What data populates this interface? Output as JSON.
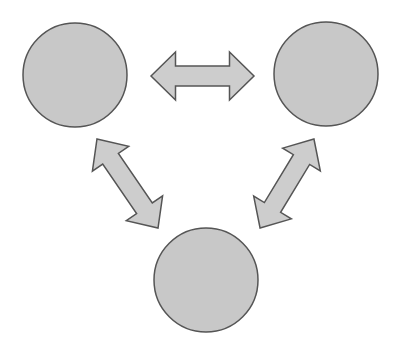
{
  "diagram": {
    "type": "cycle",
    "colors": {
      "node_fill": "#c8c8c8",
      "node_stroke": "#555555",
      "arrow_fill": "#cdcdcd",
      "arrow_stroke": "#555555",
      "background": "#ffffff"
    },
    "nodes": [
      {
        "id": "top-left",
        "label": "",
        "cx": 75,
        "cy": 75,
        "r": 52
      },
      {
        "id": "top-right",
        "label": "",
        "cx": 326,
        "cy": 74,
        "r": 52
      },
      {
        "id": "bottom",
        "label": "",
        "cx": 206,
        "cy": 280,
        "r": 52
      }
    ],
    "edges": [
      {
        "from": "top-left",
        "to": "top-right",
        "bidirectional": true
      },
      {
        "from": "top-left",
        "to": "bottom",
        "bidirectional": true
      },
      {
        "from": "top-right",
        "to": "bottom",
        "bidirectional": true
      }
    ]
  }
}
